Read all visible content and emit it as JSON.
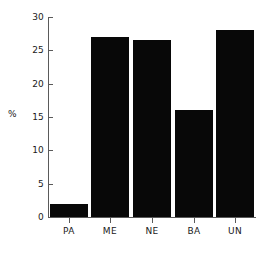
{
  "chart_data": {
    "type": "bar",
    "title": "",
    "xlabel": "",
    "ylabel": "%",
    "categories": [
      "PA",
      "ME",
      "NE",
      "BA",
      "UN"
    ],
    "values": [
      2,
      27,
      26.5,
      16,
      28
    ],
    "ylim": [
      0,
      30
    ],
    "yticks": [
      0,
      5,
      10,
      15,
      20,
      25,
      30
    ],
    "ytick_labels": [
      "0",
      "5",
      "10",
      "15",
      "20",
      "25",
      "30"
    ],
    "grid": false,
    "legend": null,
    "bar_color": "#080808",
    "axis_color": "#5a5a5a",
    "text_color": "#1a1a1a",
    "background": "#ffffff"
  }
}
